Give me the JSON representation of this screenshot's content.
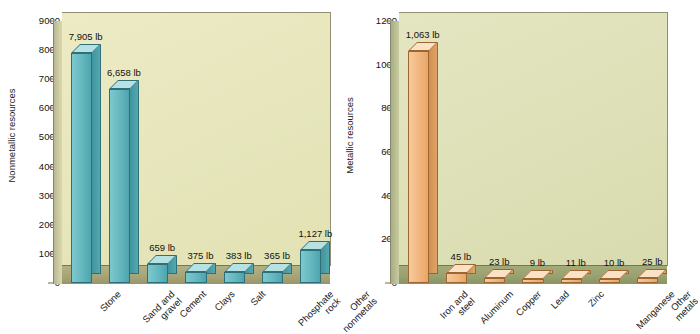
{
  "chart_data": [
    {
      "type": "bar",
      "title": "",
      "panel": "left",
      "xlabel": "",
      "ylabel": "Nonmetallic resources",
      "unit": "lb",
      "ylim": [
        0,
        9000
      ],
      "ytick_step": 1000,
      "yticks": [
        "0",
        "1000",
        "2000",
        "3000",
        "4000",
        "5000",
        "6000",
        "7000",
        "8000",
        "9000"
      ],
      "grid": false,
      "legend": "none",
      "bar_color": "#64b7bf",
      "categories": [
        "Stone",
        "Sand and gravel",
        "Cement",
        "Clays",
        "Salt",
        "Phosphate rock",
        "Other nonmetals"
      ],
      "category_lines": [
        [
          "Stone"
        ],
        [
          "Sand and",
          "gravel"
        ],
        [
          "Cement"
        ],
        [
          "Clays"
        ],
        [
          "Salt"
        ],
        [
          "Phosphate",
          "rock"
        ],
        [
          "Other",
          "nonmetals"
        ]
      ],
      "values": [
        7905,
        6658,
        659,
        375,
        383,
        365,
        1127
      ],
      "value_labels": [
        "7,905 lb",
        "6,658 lb",
        "659 lb",
        "375 lb",
        "383 lb",
        "365 lb",
        "1,127 lb"
      ]
    },
    {
      "type": "bar",
      "title": "",
      "panel": "right",
      "xlabel": "",
      "ylabel": "Metallic resources",
      "unit": "lb",
      "ylim": [
        0,
        1200
      ],
      "ytick_step": 200,
      "yticks": [
        "0",
        "200",
        "400",
        "600",
        "800",
        "1000",
        "1200"
      ],
      "grid": false,
      "legend": "none",
      "bar_color": "#f0b67f",
      "categories": [
        "Iron and steel",
        "Aluminum",
        "Copper",
        "Lead",
        "Zinc",
        "Manganese",
        "Other metals"
      ],
      "category_lines": [
        [
          "Iron and",
          "steel"
        ],
        [
          "Aluminum"
        ],
        [
          "Copper"
        ],
        [
          "Lead"
        ],
        [
          "Zinc"
        ],
        [
          "Manganese"
        ],
        [
          "Other",
          "metals"
        ]
      ],
      "values": [
        1063,
        45,
        23,
        9,
        11,
        10,
        25
      ],
      "value_labels": [
        "1,063 lb",
        "45 lb",
        "23 lb",
        "9 lb",
        "11 lb",
        "10 lb",
        "25 lb"
      ]
    }
  ]
}
